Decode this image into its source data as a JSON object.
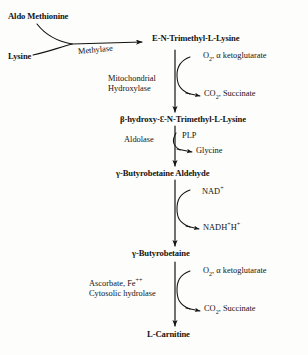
{
  "diagram": {
    "ink_color": "#141414",
    "background_color": "#fdfdfb"
  },
  "substrates": {
    "aldo_methionine": "Aldo Methionine",
    "lysine": "Lysine"
  },
  "metabolites": [
    {
      "id": "tml",
      "label": "E-N-Trimethyl-L-Lysine"
    },
    {
      "id": "html",
      "label": "β-hydroxy-Ɛ-N-Trimethyl-L-Lysine"
    },
    {
      "id": "gba",
      "label": "γ-Butyrobetaine Aldehyde"
    },
    {
      "id": "gb",
      "label": "γ-Butyrobetaine"
    },
    {
      "id": "carnitine",
      "label": "L-Carnitine"
    }
  ],
  "enzymes": [
    {
      "id": "methylase",
      "label": "Methylase"
    },
    {
      "id": "hydroxylase_line1",
      "label": "Mitochondrial"
    },
    {
      "id": "hydroxylase_line2",
      "label": "Hydroxylase"
    },
    {
      "id": "aldolase",
      "label": "Aldolase"
    },
    {
      "id": "hydrolase_line1",
      "label": "Ascorbate,  Fe"
    },
    {
      "id": "hydrolase_line1_sup",
      "label": "++"
    },
    {
      "id": "hydrolase_line2",
      "label": "Cytosolic hydrolase"
    }
  ],
  "cofactors": {
    "plp": "PLP",
    "nad_base": "NAD",
    "nad_sup": "+",
    "nadh_base": "NADH",
    "nadh_sup1": "+",
    "nadh_h": "H",
    "nadh_sup2": "+",
    "o2_base": "O",
    "o2_sub": "2",
    "o2_rest": ", α ketoglutarate",
    "co2_base": "CO",
    "co2_sub": "2",
    "co2_rest": ", Succinate",
    "glycine": "Glycine"
  }
}
